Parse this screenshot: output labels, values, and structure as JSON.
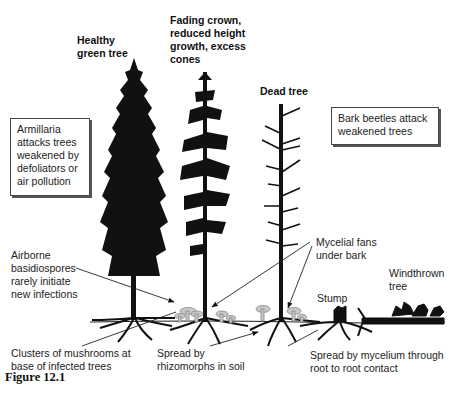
{
  "figure": {
    "caption": "Figure 12.1",
    "trees": [
      {
        "id": "healthy",
        "label_lines": [
          "Healthy",
          "green tree"
        ]
      },
      {
        "id": "fading",
        "label_lines": [
          "Fading crown,",
          "reduced height",
          "growth, excess",
          "cones"
        ]
      },
      {
        "id": "dead",
        "label_lines": [
          "Dead tree"
        ]
      },
      {
        "id": "stump",
        "label_lines": [
          "Stump"
        ]
      },
      {
        "id": "windthrown",
        "label_lines": [
          "Windthrown",
          "tree"
        ]
      }
    ],
    "boxes": {
      "armillaria": [
        "Armillaria",
        "attacks trees",
        "weakened by",
        "defoliators or",
        "air pollution"
      ],
      "bark_beetles": [
        "Bark beetles attack",
        "weakened trees"
      ]
    },
    "annotations": {
      "basidiospores": [
        "Airborne",
        "basidiospores",
        "rarely initiate",
        "new infections"
      ],
      "mycelial_fans": [
        "Mycelial fans",
        "under bark"
      ],
      "mushrooms": [
        "Clusters of mushrooms at",
        "base of infected trees"
      ],
      "rhizomorphs": [
        "Spread by",
        "rhizomorphs in soil"
      ],
      "root_contact": [
        "Spread by mycelium through",
        "root to root contact"
      ]
    },
    "colors": {
      "ink": "#111111",
      "mushroom": "#b8b8b8",
      "background": "#ffffff"
    }
  }
}
